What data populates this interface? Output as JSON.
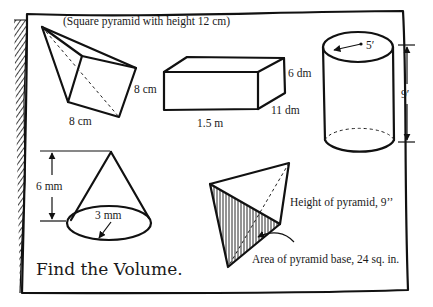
{
  "worksheet": {
    "instruction": "Find the Volume.",
    "colors": {
      "ink": "#111111",
      "paper": "#ffffff"
    }
  },
  "figures": {
    "square_pyramid": {
      "caption": "(Square pyramid with height 12 cm)",
      "side_label": "8 cm",
      "base_label": "8 cm"
    },
    "rectangular_prism": {
      "length_label": "1.5 m",
      "depth_label": "11 dm",
      "height_label": "6 dm"
    },
    "cylinder": {
      "radius_label": "5′",
      "height_label": "9′"
    },
    "cone": {
      "height_label": "6 mm",
      "radius_label": "3 mm"
    },
    "triangular_pyramid": {
      "height_label": "Height of pyramid, 9’’",
      "base_label": "Area of pyramid base, 24 sq. in."
    }
  }
}
